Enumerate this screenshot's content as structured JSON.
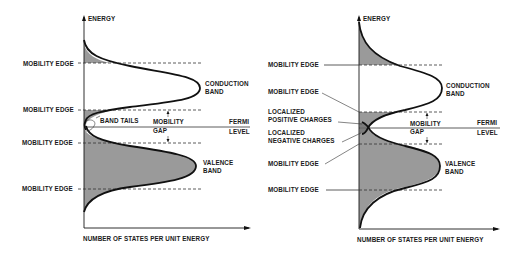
{
  "figure": {
    "left_panel": {
      "y_axis_label": "ENERGY",
      "x_axis_label": "NUMBER OF STATES PER UNIT ENERGY",
      "labels": {
        "mobility_edge_1": "MOBILITY EDGE",
        "mobility_edge_2": "MOBILITY EDGE",
        "mobility_edge_3": "MOBILITY EDGE",
        "mobility_edge_4": "MOBILITY EDGE",
        "band_tails": "BAND TAILS",
        "mobility": "MOBILITY",
        "gap": "GAP",
        "fermi": "FERMI",
        "level": "LEVEL",
        "conduction": "CONDUCTION",
        "conduction_band": "BAND",
        "valence": "VALENCE",
        "valence_band": "BAND"
      }
    },
    "right_panel": {
      "y_axis_label": "ENERGY",
      "x_axis_label": "NUMBER OF STATES PER UNIT ENERGY",
      "labels": {
        "mobility_edge_1": "MOBILITY EDGE",
        "mobility_edge_2": "MOBILITY EDGE",
        "localized_pos_1": "LOCALIZED",
        "localized_pos_2": "POSITIVE CHARGES",
        "localized_neg_1": "LOCALIZED",
        "localized_neg_2": "NEGATIVE CHARGES",
        "mobility_edge_3": "MOBILITY EDGE",
        "mobility_edge_4": "MOBILITY EDGE",
        "mobility": "MOBILITY",
        "gap": "GAP",
        "fermi": "FERMI",
        "level": "LEVEL",
        "conduction": "CONDUCTION",
        "conduction_band": "BAND",
        "valence": "VALENCE",
        "valence_band": "BAND"
      }
    }
  }
}
